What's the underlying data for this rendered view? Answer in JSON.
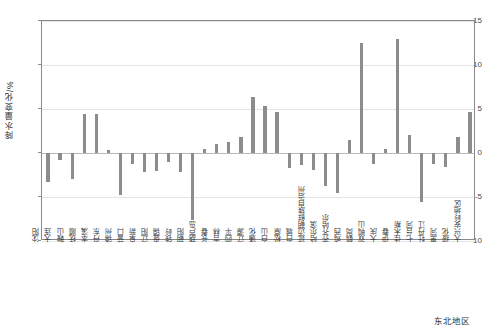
{
  "chart_data": {
    "type": "bar",
    "title": "",
    "xlabel": "东北地区",
    "ylabel": "降水量变化/%",
    "ylim": [
      -10,
      15
    ],
    "yticks": [
      -10,
      -5,
      0,
      5,
      10,
      15
    ],
    "ytick_labels": [
      "-10",
      "-5",
      "0",
      "5",
      "10",
      "15"
    ],
    "grid": true,
    "legend": "none",
    "bar_color": "#8c8c8c",
    "categories": [
      "沈阳",
      "大连",
      "鞍山",
      "抚顺",
      "本溪",
      "丹东",
      "锦州",
      "营口",
      "阜新",
      "辽阳",
      "盘锦",
      "铁岭",
      "朝阳",
      "葫芦岛",
      "长春",
      "吉林",
      "四平",
      "辽源",
      "通化",
      "白山",
      "松原",
      "白城",
      "延边朝鲜族自治州",
      "哈尔滨",
      "齐齐哈尔",
      "鸡西",
      "鹤岗",
      "双鸭山",
      "大庆",
      "伊春",
      "佳木斯",
      "七台河",
      "牡丹江",
      "黑河",
      "绥化",
      "大兴安岭地区"
    ],
    "values": [
      -3.3,
      -0.8,
      -2.9,
      4.4,
      4.4,
      0.3,
      -4.8,
      -1.2,
      -2.2,
      -2.1,
      -1.0,
      -2.2,
      -7.6,
      0.4,
      1.0,
      1.3,
      1.8,
      6.4,
      5.3,
      4.7,
      -1.7,
      -1.4,
      -1.9,
      -3.7,
      -4.5,
      1.5,
      12.5,
      -1.2,
      0.5,
      13.0,
      2.1,
      -5.6,
      -1.3,
      -1.6,
      1.8,
      4.7
    ]
  },
  "axes": {
    "y_title": "降水量变化/%",
    "x_title": "东北地区"
  }
}
